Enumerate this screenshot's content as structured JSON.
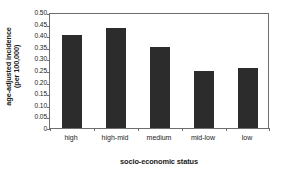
{
  "chart_data": {
    "type": "bar",
    "title": "",
    "xlabel": "socio-economic status",
    "ylabel": "age-adjusted incidence (per 100,000)",
    "ylabel_lines": [
      "age-adjusted incidence",
      "(per 100,000)"
    ],
    "categories": [
      "high",
      "high-mid",
      "medium",
      "mid-low",
      "low"
    ],
    "values": [
      0.4,
      0.43,
      0.35,
      0.245,
      0.26
    ],
    "ylim": [
      0,
      0.5
    ],
    "ytick_values": [
      0.5,
      0.45,
      0.4,
      0.35,
      0.3,
      0.25,
      0.2,
      0.15,
      0.1,
      0.05,
      0
    ],
    "ytick_labels": [
      "0.50",
      "0.45",
      "0.40",
      "0.35",
      "0.30",
      "0.25",
      "0.20",
      "0.15",
      "0.10",
      "0.05",
      "0"
    ],
    "grid": false,
    "legend": null,
    "bar_color": "#2c2c2c",
    "axis_color": "#6e6e6e",
    "background_color": "#ffffff"
  }
}
